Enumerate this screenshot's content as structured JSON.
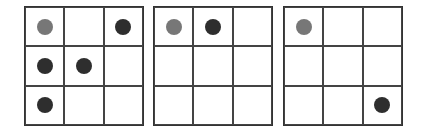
{
  "colors": {
    "dark_dot": "#2e2e2e",
    "light_dot": "#777777",
    "line": "#444444"
  },
  "grids": [
    {
      "id": "grid-1",
      "left": 24,
      "cells": [
        "light",
        "empty",
        "dark",
        "dark",
        "dark",
        "empty",
        "dark",
        "empty",
        "empty"
      ]
    },
    {
      "id": "grid-2",
      "left": 153,
      "cells": [
        "light",
        "dark",
        "empty",
        "empty",
        "empty",
        "empty",
        "empty",
        "empty",
        "empty"
      ]
    },
    {
      "id": "grid-3",
      "left": 283,
      "cells": [
        "light",
        "empty",
        "empty",
        "empty",
        "empty",
        "empty",
        "empty",
        "empty",
        "dark"
      ]
    }
  ]
}
